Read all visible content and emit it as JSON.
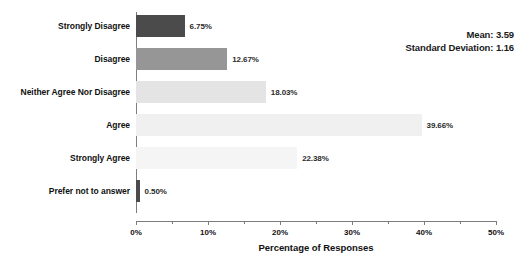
{
  "chart_data": {
    "type": "bar",
    "orientation": "horizontal",
    "title": "",
    "xlabel": "Percentage of Responses",
    "ylabel": "",
    "xlim": [
      0,
      50
    ],
    "xticks": [
      "0%",
      "10%",
      "20%",
      "30%",
      "40%",
      "50%"
    ],
    "xtick_values": [
      0,
      10,
      20,
      30,
      40,
      50
    ],
    "grid": false,
    "legend": false,
    "categories": [
      "Strongly Disagree",
      "Disagree",
      "Neither Agree Nor Disagree",
      "Agree",
      "Strongly Agree",
      "Prefer not to answer"
    ],
    "values": [
      6.75,
      12.67,
      18.03,
      39.66,
      22.38,
      0.5
    ],
    "value_labels": [
      "6.75%",
      "12.67%",
      "18.03%",
      "39.66%",
      "22.38%",
      "0.50%"
    ],
    "bar_colors": [
      "#4b4b4b",
      "#969696",
      "#e4e4e4",
      "#f0f0f0",
      "#f5f5f5",
      "#4b4b4b"
    ],
    "annotations": {
      "mean_label": "Mean: 3.59",
      "std_label": "Standard Deviation: 1.16"
    }
  }
}
